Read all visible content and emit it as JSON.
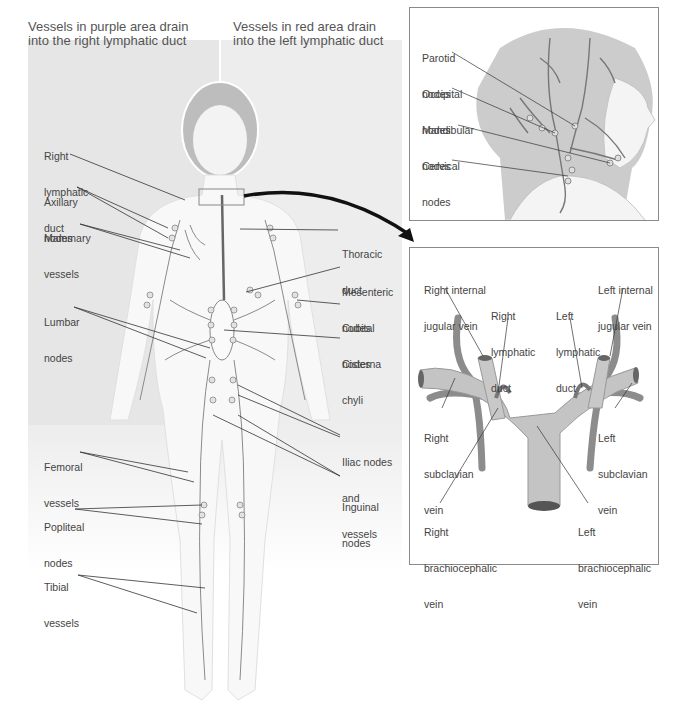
{
  "header": {
    "left_caption_line1": "Vessels in purple area drain",
    "left_caption_line2": "into the right lymphatic duct",
    "right_caption_line1": "Vessels in red area drain",
    "right_caption_line2": "into the left lymphatic duct"
  },
  "body_labels": {
    "right_lymphatic_duct": [
      "Right",
      "lymphatic",
      "duct"
    ],
    "axillary_nodes": [
      "Axillary",
      "nodes"
    ],
    "mammary_vessels": [
      "Mammary",
      "vessels"
    ],
    "lumbar_nodes": [
      "Lumbar",
      "nodes"
    ],
    "femoral_vessels": [
      "Femoral",
      "vessels"
    ],
    "popliteal_nodes": [
      "Popliteal",
      "nodes"
    ],
    "tibial_vessels": [
      "Tibial",
      "vessels"
    ],
    "thoracic_duct": [
      "Thoracic",
      "duct"
    ],
    "mesenteric_nodes": [
      "Mesenteric",
      "nodes"
    ],
    "cubital_nodes": [
      "Cubital",
      "nodes"
    ],
    "cisterna_chyli": [
      "Cisterna",
      "chyli"
    ],
    "iliac_nodes": [
      "Iliac nodes",
      "and",
      "vessels"
    ],
    "inguinal_nodes": [
      "Inguinal",
      "nodes"
    ]
  },
  "head_panel": {
    "parotid": [
      "Parotid",
      "nodes"
    ],
    "occipital": [
      "Occipital",
      "nodes"
    ],
    "mandibular": [
      "Mandibular",
      "nodes"
    ],
    "cervical": [
      "Cervical",
      "nodes"
    ]
  },
  "vein_panel": {
    "right_internal_jugular": [
      "Right internal",
      "jugular vein"
    ],
    "right_lymphatic_duct": [
      "Right",
      "lymphatic",
      "duct"
    ],
    "left_lymphatic_duct": [
      "Left",
      "lymphatic",
      "duct"
    ],
    "left_internal_jugular": [
      "Left internal",
      "jugular vein"
    ],
    "right_subclavian": [
      "Right",
      "subclavian",
      "vein"
    ],
    "left_subclavian": [
      "Left",
      "subclavian",
      "vein"
    ],
    "right_brachiocephalic": [
      "Right",
      "brachiocephalic",
      "vein"
    ],
    "left_brachiocephalic": [
      "Left",
      "brachiocephalic",
      "vein"
    ]
  },
  "colors": {
    "left_region": "#e6e6e6",
    "right_region": "#ededed",
    "vessel": "#7a7a7a",
    "vein": "#b5b5b5",
    "panel_border": "#8a8a8a"
  }
}
